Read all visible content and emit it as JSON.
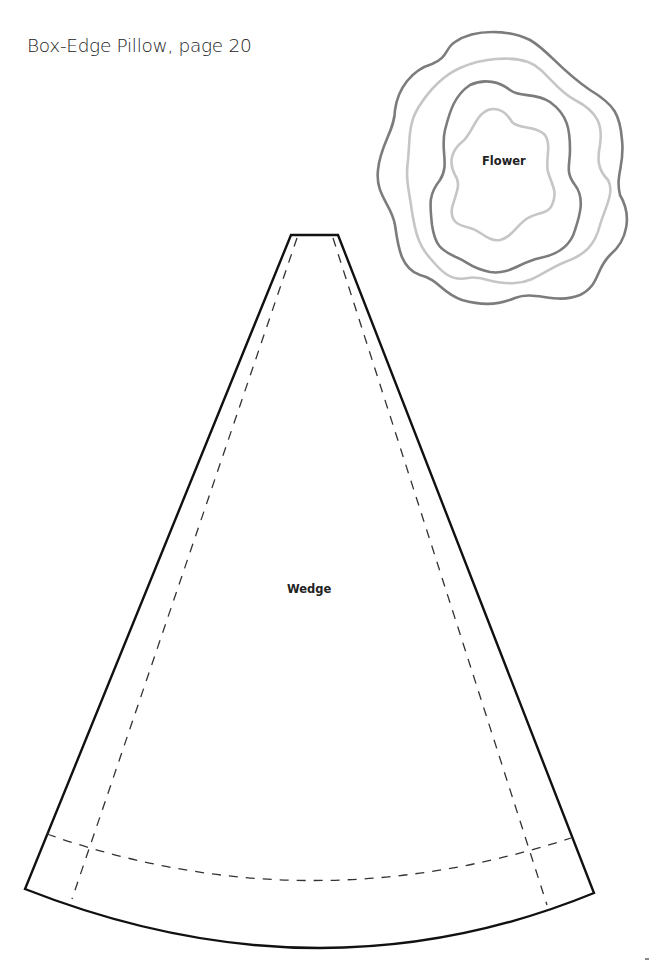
{
  "page": {
    "title": "Box-Edge Pillow, page 20"
  },
  "pattern_pieces": {
    "flower": {
      "label": "Flower",
      "outline_colors": [
        "#7a7a7a",
        "#c4c4c4",
        "#7a7a7a",
        "#c4c4c4"
      ]
    },
    "wedge": {
      "label": "Wedge",
      "cut_line_color": "#111111",
      "seam_line_color": "#333333"
    }
  }
}
